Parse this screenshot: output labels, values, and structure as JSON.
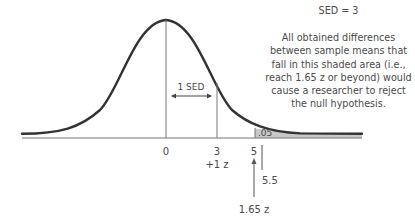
{
  "figure": {
    "sed_label": "SED = 3",
    "annotation": "All obtained differences between sample means that fall in this shaded area (i.e., reach 1.65 z or beyond) would cause a researcher to reject the null hypothesis.",
    "sed_bracket_label": "1 SED",
    "shaded_area_label": ".05",
    "ticks": [
      {
        "value": "0",
        "sub": ""
      },
      {
        "value": "3",
        "sub": "+1 z"
      },
      {
        "value": "5",
        "sub": ""
      }
    ],
    "critical_value_label": "5.5",
    "critical_z_label": "1.65 z"
  },
  "colors": {
    "curve": "#333333",
    "shade": "#c8c8c8",
    "lines": "#777777",
    "text": "#4a4a4a"
  }
}
